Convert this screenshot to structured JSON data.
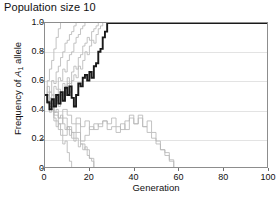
{
  "title": "Population size 10",
  "axes": {
    "xlabel": "Generation",
    "ylabel_prefix": "Frequency of ",
    "ylabel_symbol": "A",
    "ylabel_subscript": "1",
    "ylabel_suffix": " allele",
    "xticks": [
      "0",
      "20",
      "40",
      "60",
      "80",
      "100"
    ],
    "yticks": [
      "1.0",
      "0.8",
      "0.6",
      "0.4",
      "0.2",
      "0"
    ]
  },
  "colors": {
    "highlight_line": "#1a1a1a",
    "replicate_line": "#b8b8b8",
    "gridline": "#e3e3e3",
    "frame": "#8d8d8d",
    "text": "#111111"
  },
  "chart_data": {
    "type": "line",
    "title": "Population size 10",
    "xlabel": "Generation",
    "ylabel": "Frequency of A1 allele",
    "xlim": [
      0,
      100
    ],
    "ylim": [
      0,
      1
    ],
    "xticks": [
      0,
      20,
      40,
      60,
      80,
      100
    ],
    "yticks": [
      0,
      0.2,
      0.4,
      0.6,
      0.8,
      1.0
    ],
    "grid": "horizontal",
    "legend": "none",
    "annotation": "Wright-Fisher genetic drift simulation: 10 replicate populations of size 10, all starting at allele frequency 0.5; one replicate highlighted in black. Most replicates fix at 1.0 or are lost at 0.0 within ~60 generations.",
    "series": [
      {
        "name": "highlighted-replicate",
        "color": "#1a1a1a",
        "highlight": true,
        "x": [
          0,
          1,
          2,
          3,
          4,
          5,
          6,
          7,
          8,
          9,
          10,
          11,
          12,
          13,
          14,
          15,
          16,
          17,
          18,
          19,
          20,
          21,
          22,
          23,
          24,
          25,
          26,
          27,
          28,
          100
        ],
        "values": [
          0.5,
          0.45,
          0.4,
          0.47,
          0.42,
          0.5,
          0.44,
          0.52,
          0.46,
          0.55,
          0.5,
          0.56,
          0.48,
          0.42,
          0.5,
          0.58,
          0.56,
          0.62,
          0.64,
          0.6,
          0.66,
          0.62,
          0.7,
          0.72,
          0.8,
          0.82,
          0.9,
          0.94,
          1.0,
          1.0
        ]
      },
      {
        "name": "replicate-1",
        "color": "#b8b8b8",
        "x": [
          0,
          1,
          2,
          3,
          4,
          5,
          6,
          7
        ],
        "values": [
          0.5,
          0.6,
          0.68,
          0.74,
          0.82,
          0.9,
          0.96,
          1.0
        ]
      },
      {
        "name": "replicate-2",
        "color": "#b8b8b8",
        "x": [
          0,
          1,
          2,
          3,
          4,
          5,
          6,
          7,
          8,
          9,
          10,
          11,
          12,
          13,
          14
        ],
        "values": [
          0.5,
          0.56,
          0.52,
          0.6,
          0.58,
          0.66,
          0.7,
          0.76,
          0.8,
          0.86,
          0.88,
          0.92,
          0.94,
          0.98,
          1.0
        ]
      },
      {
        "name": "replicate-3",
        "color": "#b8b8b8",
        "x": [
          0,
          1,
          2,
          3,
          4,
          5,
          6,
          7,
          8,
          9,
          10,
          11,
          12,
          13,
          14,
          15,
          16,
          17,
          18
        ],
        "values": [
          0.5,
          0.46,
          0.52,
          0.5,
          0.56,
          0.54,
          0.62,
          0.6,
          0.68,
          0.66,
          0.74,
          0.78,
          0.8,
          0.86,
          0.9,
          0.92,
          0.96,
          0.98,
          1.0
        ]
      },
      {
        "name": "replicate-4",
        "color": "#b8b8b8",
        "x": [
          0,
          1,
          2,
          3,
          4,
          5,
          6,
          7,
          8,
          9,
          10,
          11,
          12,
          13,
          14,
          15,
          16,
          17,
          18,
          19,
          20,
          21,
          22,
          23,
          24
        ],
        "values": [
          0.5,
          0.44,
          0.48,
          0.42,
          0.5,
          0.46,
          0.54,
          0.5,
          0.58,
          0.56,
          0.62,
          0.58,
          0.66,
          0.7,
          0.68,
          0.76,
          0.78,
          0.84,
          0.86,
          0.9,
          0.88,
          0.94,
          0.96,
          0.98,
          1.0
        ]
      },
      {
        "name": "replicate-5",
        "color": "#b8b8b8",
        "x": [
          0,
          1,
          2,
          3,
          4,
          5,
          6,
          7,
          8,
          9,
          10,
          11,
          12,
          13,
          14,
          15,
          16,
          17,
          18,
          19,
          20,
          21,
          22,
          23,
          24,
          25,
          26
        ],
        "values": [
          0.5,
          0.52,
          0.46,
          0.5,
          0.44,
          0.48,
          0.42,
          0.5,
          0.46,
          0.54,
          0.58,
          0.52,
          0.6,
          0.64,
          0.62,
          0.7,
          0.68,
          0.74,
          0.8,
          0.78,
          0.84,
          0.88,
          0.86,
          0.92,
          0.96,
          0.98,
          1.0
        ]
      },
      {
        "name": "replicate-6",
        "color": "#b8b8b8",
        "x": [
          0,
          1,
          2,
          3,
          4,
          5,
          6,
          7,
          8,
          9,
          10,
          11,
          12
        ],
        "values": [
          0.5,
          0.44,
          0.38,
          0.42,
          0.34,
          0.28,
          0.3,
          0.22,
          0.16,
          0.18,
          0.1,
          0.04,
          0.0
        ]
      },
      {
        "name": "replicate-7",
        "color": "#b8b8b8",
        "x": [
          0,
          1,
          2,
          3,
          4,
          5,
          6,
          7,
          8,
          9,
          10,
          11,
          12,
          13,
          14,
          15,
          16,
          17,
          18,
          19,
          20,
          21,
          22
        ],
        "values": [
          0.5,
          0.46,
          0.42,
          0.46,
          0.38,
          0.4,
          0.34,
          0.36,
          0.3,
          0.26,
          0.28,
          0.22,
          0.24,
          0.18,
          0.2,
          0.14,
          0.16,
          0.12,
          0.14,
          0.08,
          0.06,
          0.04,
          0.0
        ]
      },
      {
        "name": "replicate-8",
        "color": "#b8b8b8",
        "x": [
          0,
          2,
          4,
          6,
          8,
          10,
          12,
          14,
          16,
          18,
          20,
          22
        ],
        "values": [
          0.5,
          0.42,
          0.36,
          0.3,
          0.34,
          0.26,
          0.2,
          0.24,
          0.16,
          0.12,
          0.06,
          0.0
        ]
      },
      {
        "name": "replicate-9",
        "color": "#b8b8b8",
        "x": [
          0,
          2,
          4,
          6,
          8,
          10,
          12,
          14,
          16,
          18,
          20,
          22,
          24,
          26,
          28,
          30,
          32,
          34,
          36,
          38,
          40,
          42,
          44,
          46,
          48,
          50,
          52,
          54,
          56,
          58
        ],
        "values": [
          0.5,
          0.44,
          0.38,
          0.34,
          0.4,
          0.36,
          0.3,
          0.34,
          0.28,
          0.32,
          0.26,
          0.3,
          0.28,
          0.32,
          0.3,
          0.34,
          0.28,
          0.26,
          0.32,
          0.36,
          0.3,
          0.34,
          0.28,
          0.24,
          0.2,
          0.16,
          0.12,
          0.08,
          0.04,
          0.0
        ]
      },
      {
        "name": "replicate-10",
        "color": "#b8b8b8",
        "x": [
          0,
          2,
          4,
          6,
          8,
          10,
          12,
          14,
          16,
          18,
          20,
          22,
          24,
          26,
          28,
          30,
          32,
          34,
          36,
          38,
          40,
          42,
          44,
          46,
          48,
          50,
          52,
          54,
          56,
          58
        ],
        "values": [
          0.5,
          0.4,
          0.32,
          0.26,
          0.22,
          0.28,
          0.24,
          0.3,
          0.18,
          0.22,
          0.28,
          0.26,
          0.3,
          0.32,
          0.26,
          0.28,
          0.24,
          0.3,
          0.26,
          0.34,
          0.3,
          0.36,
          0.28,
          0.32,
          0.24,
          0.18,
          0.12,
          0.1,
          0.05,
          0.0
        ]
      }
    ]
  }
}
